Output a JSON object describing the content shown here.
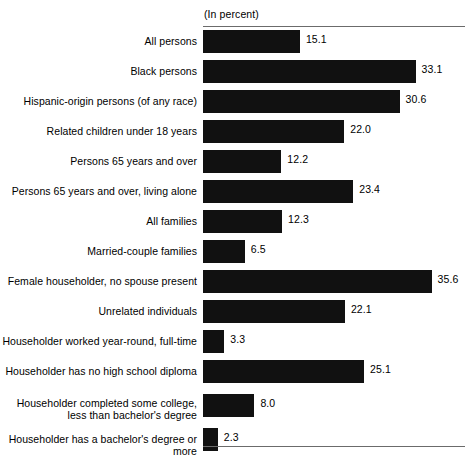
{
  "chart_data": {
    "type": "bar",
    "orientation": "horizontal",
    "title": "",
    "subtitle": "",
    "unit_caption": "(In percent)",
    "xlabel": "",
    "ylabel": "",
    "xlim": [
      0,
      41
    ],
    "grid": false,
    "legend": null,
    "value_labels": true,
    "bar_color": "#111111",
    "axis_color": "#6b6b6b",
    "categories": [
      "All persons",
      "Black persons",
      "Hispanic-origin persons (of any race)",
      "Related children under 18 years",
      "Persons 65 years and over",
      "Persons 65 years and over, living alone",
      "All families",
      "Married-couple families",
      "Female householder, no spouse present",
      "Unrelated individuals",
      "Householder worked year-round, full-time",
      "Householder has no high school diploma",
      "Householder completed some college,\nless than bachelor's degree",
      "Householder has a bachelor's degree or more"
    ],
    "values": [
      15.1,
      33.1,
      30.6,
      22.0,
      12.2,
      23.4,
      12.3,
      6.5,
      35.6,
      22.1,
      3.3,
      25.1,
      8.0,
      2.3
    ],
    "value_text": [
      "15.1",
      "33.1",
      "30.6",
      "22.0",
      "12.2",
      "23.4",
      "12.3",
      "6.5",
      "35.6",
      "22.1",
      "3.3",
      "25.1",
      "8.0",
      "2.3"
    ],
    "rows": [
      {
        "label": "All persons",
        "value": 15.1,
        "value_text": "15.1",
        "tall": false
      },
      {
        "label": "Black persons",
        "value": 33.1,
        "value_text": "33.1",
        "tall": false
      },
      {
        "label": "Hispanic-origin persons (of any race)",
        "value": 30.6,
        "value_text": "30.6",
        "tall": false
      },
      {
        "label": "Related children under 18 years",
        "value": 22.0,
        "value_text": "22.0",
        "tall": false
      },
      {
        "label": "Persons 65 years and over",
        "value": 12.2,
        "value_text": "12.2",
        "tall": false
      },
      {
        "label": "Persons 65 years and over, living alone",
        "value": 23.4,
        "value_text": "23.4",
        "tall": false
      },
      {
        "label": "All families",
        "value": 12.3,
        "value_text": "12.3",
        "tall": false
      },
      {
        "label": "Married-couple families",
        "value": 6.5,
        "value_text": "6.5",
        "tall": false
      },
      {
        "label": "Female householder, no spouse present",
        "value": 35.6,
        "value_text": "35.6",
        "tall": false
      },
      {
        "label": "Unrelated individuals",
        "value": 22.1,
        "value_text": "22.1",
        "tall": false
      },
      {
        "label": "Householder worked year-round, full-time",
        "value": 3.3,
        "value_text": "3.3",
        "tall": false
      },
      {
        "label": "Householder has no high school diploma",
        "value": 25.1,
        "value_text": "25.1",
        "tall": false
      },
      {
        "label": "Householder completed some college,\nless than bachelor's degree",
        "value": 8.0,
        "value_text": "8.0",
        "tall": true
      },
      {
        "label": "Householder has a bachelor's degree or more",
        "value": 2.3,
        "value_text": "2.3",
        "tall": false
      }
    ]
  }
}
